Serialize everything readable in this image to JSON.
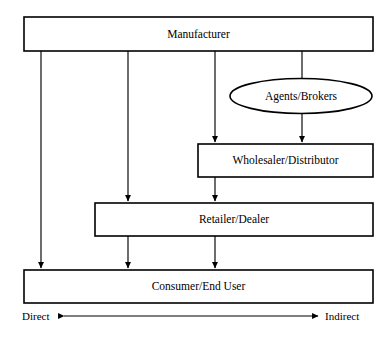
{
  "diagram": {
    "nodes": [
      {
        "id": "manufacturer",
        "label": "Manufacturer",
        "shape": "rect",
        "x": 24,
        "y": 17,
        "width": 349,
        "height": 34
      },
      {
        "id": "agents",
        "label": "Agents/Brokers",
        "shape": "ellipse",
        "cx": 301,
        "cy": 96,
        "rx": 71,
        "ry": 17.5
      },
      {
        "id": "wholesaler",
        "label": "Wholesaler/Distributor",
        "shape": "rect",
        "x": 198,
        "y": 144,
        "width": 175,
        "height": 33
      },
      {
        "id": "retailer",
        "label": "Retailer/Dealer",
        "shape": "rect",
        "x": 95,
        "y": 203,
        "width": 278,
        "height": 33
      },
      {
        "id": "consumer",
        "label": "Consumer/End User",
        "shape": "rect",
        "x": 24,
        "y": 270,
        "width": 349,
        "height": 33
      }
    ],
    "connectors": [
      {
        "id": "manufacturer-to-consumer",
        "from": "manufacturer",
        "to": "consumer",
        "x": 41,
        "y1": 51,
        "y2": 269
      },
      {
        "id": "manufacturer-to-retailer",
        "from": "manufacturer",
        "to": "retailer",
        "x": 128,
        "y1": 51,
        "y2": 202
      },
      {
        "id": "retailer-to-consumer-left",
        "from": "retailer",
        "to": "consumer",
        "x": 128,
        "y1": 236,
        "y2": 269
      },
      {
        "id": "manufacturer-to-wholesaler",
        "from": "manufacturer",
        "to": "wholesaler",
        "x": 215,
        "y1": 51,
        "y2": 143
      },
      {
        "id": "wholesaler-to-retailer",
        "from": "wholesaler",
        "to": "retailer",
        "x": 215,
        "y1": 177,
        "y2": 202
      },
      {
        "id": "retailer-to-consumer-mid",
        "from": "retailer",
        "to": "consumer",
        "x": 215,
        "y1": 236,
        "y2": 269
      },
      {
        "id": "manufacturer-to-agents",
        "from": "manufacturer",
        "to": "agents",
        "x": 302,
        "y1": 51,
        "y2": 79,
        "arrow": false
      },
      {
        "id": "agents-to-wholesaler",
        "from": "agents",
        "to": "wholesaler",
        "x": 302,
        "y1": 113,
        "y2": 143
      }
    ],
    "axis": {
      "left_label": "Direct",
      "right_label": "Indirect",
      "line_x1": 58,
      "line_x2": 320,
      "line_y": 316
    }
  },
  "colors": {
    "stroke": "#000000",
    "fill": "#ffffff",
    "background": "#ffffff"
  }
}
